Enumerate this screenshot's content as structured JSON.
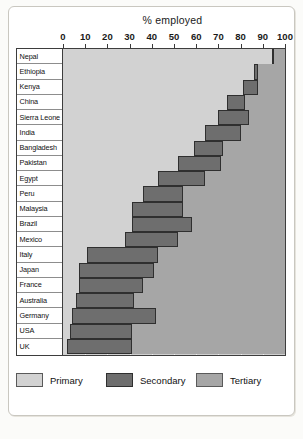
{
  "chart_data": {
    "type": "bar",
    "orientation": "horizontal",
    "stacked": true,
    "title": "% employed",
    "xlabel": "% employed",
    "ylabel": "",
    "xlim": [
      0,
      100
    ],
    "xticks": [
      0,
      10,
      20,
      30,
      40,
      50,
      60,
      70,
      80,
      90,
      100
    ],
    "xtick_labels": [
      "0",
      "10",
      "20",
      "30",
      "40",
      "50",
      "60",
      "70",
      "80",
      "90",
      "100"
    ],
    "grid": true,
    "legend_position": "bottom",
    "categories": [
      "Nepal",
      "Ethiopia",
      "Kenya",
      "China",
      "Sierra Leone",
      "India",
      "Bangladesh",
      "Pakistan",
      "Egypt",
      "Peru",
      "Malaysia",
      "Brazil",
      "Mexico",
      "Italy",
      "Japan",
      "France",
      "Australia",
      "Germany",
      "USA",
      "UK"
    ],
    "series": [
      {
        "name": "Primary",
        "color": "#d2d2d2",
        "values": [
          94,
          86,
          81,
          74,
          70,
          64,
          59,
          52,
          43,
          36,
          31,
          31,
          28,
          11,
          7,
          7,
          6,
          4,
          3,
          2
        ]
      },
      {
        "name": "Secondary",
        "color": "#6e6e6e",
        "values": [
          1,
          2,
          7,
          8,
          14,
          16,
          13,
          19,
          21,
          18,
          23,
          27,
          24,
          32,
          34,
          29,
          26,
          38,
          28,
          29
        ]
      },
      {
        "name": "Tertiary",
        "color": "#a6a6a6",
        "values": [
          5,
          12,
          12,
          18,
          16,
          20,
          28,
          29,
          36,
          46,
          46,
          42,
          48,
          57,
          59,
          64,
          68,
          58,
          69,
          69
        ]
      }
    ]
  },
  "legend": {
    "items": [
      {
        "label": "Primary",
        "color": "#d2d2d2"
      },
      {
        "label": "Secondary",
        "color": "#6e6e6e"
      },
      {
        "label": "Tertiary",
        "color": "#a6a6a6"
      }
    ]
  }
}
